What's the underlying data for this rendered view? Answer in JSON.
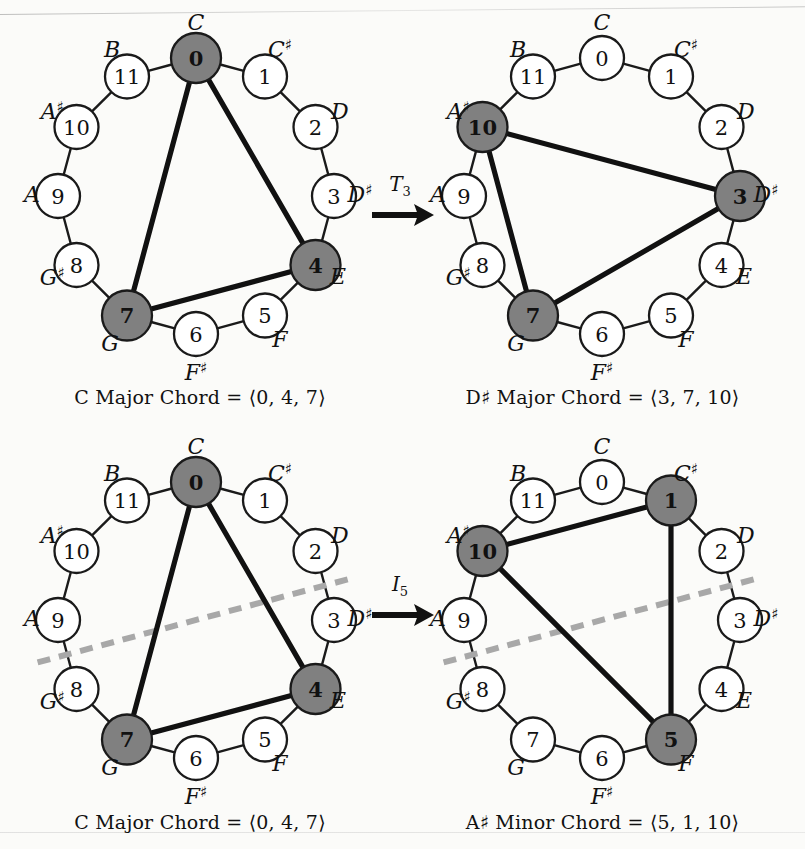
{
  "figure": {
    "note_names": [
      "C",
      "C♯",
      "D",
      "D♯",
      "E",
      "F",
      "F♯",
      "G",
      "G♯",
      "A",
      "A♯",
      "B"
    ],
    "pitch_classes": [
      "0",
      "1",
      "2",
      "3",
      "4",
      "5",
      "6",
      "7",
      "8",
      "9",
      "10",
      "11"
    ],
    "colors": {
      "page_background": "#fbfbf9",
      "node_fill_default": "#ffffff",
      "node_fill_highlight": "#808080",
      "node_stroke": "#1a1a1a",
      "chord_edge": "#111111",
      "ring_edge": "#1a1a1a",
      "inversion_axis": "#a8a8a8",
      "text": "#111111"
    },
    "labels": {
      "equals": "=",
      "open_angle": "⟨",
      "close_angle": "⟩",
      "comma": ","
    }
  },
  "panels": [
    {
      "id": "top-left",
      "highlighted": [
        0,
        4,
        7
      ],
      "chord_edges": [
        [
          0,
          4
        ],
        [
          4,
          7
        ],
        [
          7,
          0
        ]
      ],
      "axis": null,
      "caption": {
        "root": "C",
        "root_sharp": "",
        "quality": "Major",
        "word_chord": "Chord",
        "set": [
          "0",
          "4",
          "7"
        ],
        "text": "C Major Chord = ⟨0, 4, 7⟩"
      }
    },
    {
      "id": "top-right",
      "highlighted": [
        10,
        3,
        7
      ],
      "chord_edges": [
        [
          10,
          3
        ],
        [
          3,
          7
        ],
        [
          7,
          10
        ]
      ],
      "axis": null,
      "caption": {
        "root": "D",
        "root_sharp": "♯",
        "quality": "Major",
        "word_chord": "Chord",
        "set": [
          "3",
          "7",
          "10"
        ],
        "text": "D♯ Major Chord = ⟨3, 7, 10⟩"
      }
    },
    {
      "id": "bottom-left",
      "highlighted": [
        0,
        4,
        7
      ],
      "chord_edges": [
        [
          0,
          4
        ],
        [
          4,
          7
        ],
        [
          7,
          0
        ]
      ],
      "axis": {
        "from": 2.5,
        "to": 8.5,
        "style": "dashed"
      },
      "caption": {
        "root": "C",
        "root_sharp": "",
        "quality": "Major",
        "word_chord": "Chord",
        "set": [
          "0",
          "4",
          "7"
        ],
        "text": "C Major Chord = ⟨0, 4, 7⟩"
      }
    },
    {
      "id": "bottom-right",
      "highlighted": [
        10,
        1,
        5
      ],
      "chord_edges": [
        [
          10,
          1
        ],
        [
          1,
          5
        ],
        [
          5,
          10
        ]
      ],
      "axis": {
        "from": 2.5,
        "to": 8.5,
        "style": "dashed"
      },
      "caption": {
        "root": "A",
        "root_sharp": "♯",
        "quality": "Minor",
        "word_chord": "Chord",
        "set": [
          "5",
          "1",
          "10"
        ],
        "text": "A♯ Minor Chord = ⟨5, 1, 10⟩"
      }
    }
  ],
  "arrows": [
    {
      "id": "arrow-top",
      "operation": "T",
      "subscript": "3",
      "label": "T₃",
      "meaning": "transposition by 3"
    },
    {
      "id": "arrow-bottom",
      "operation": "I",
      "subscript": "5",
      "label": "I₅",
      "meaning": "inversion about 5"
    }
  ]
}
